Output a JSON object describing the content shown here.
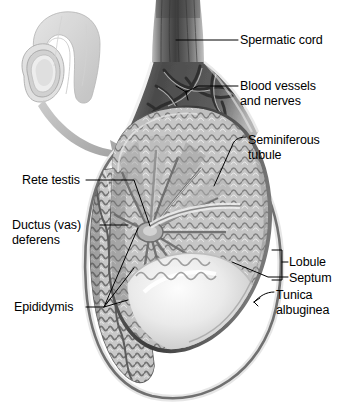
{
  "figure": {
    "background_color": "#ffffff",
    "palette": {
      "ink": "#000000",
      "dark_tissue": "#4a4a4a",
      "mid_tissue": "#8f8f8f",
      "light_tissue": "#c8c8c8",
      "pale_tissue": "#e2e2e2",
      "highlight": "#f4f4f4",
      "outline": "#5a5a5a",
      "arrow": "#a9a9a9",
      "inset": "#d0d0d0"
    }
  },
  "inset": {
    "name": "penis-and-scrotum-orientation-inset",
    "description": "Small pale gray drawing of the penis and scrotum showing the location of the magnified testis"
  },
  "arrow": {
    "name": "magnification-arrow",
    "description": "Curved gray arrow sweeping from the inset down to the main testis illustration"
  },
  "labels": [
    {
      "id": "spermatic-cord",
      "text": "Spermatic cord",
      "side": "right",
      "x": 240,
      "y": 33,
      "lines": 1
    },
    {
      "id": "blood-vessels-and-nerves",
      "text": "Blood vessels\nand nerves",
      "side": "right",
      "x": 240,
      "y": 79,
      "lines": 2
    },
    {
      "id": "seminiferous-tubule",
      "text": "Seminiferous\ntubule",
      "side": "right",
      "x": 248,
      "y": 133,
      "lines": 2
    },
    {
      "id": "rete-testis",
      "text": "Rete testis",
      "side": "left",
      "x": 22,
      "y": 173,
      "lines": 1
    },
    {
      "id": "ductus-vas-deferens",
      "text": "Ductus (vas)\ndeferens",
      "side": "left",
      "x": 12,
      "y": 218,
      "lines": 2
    },
    {
      "id": "epididymis",
      "text": "Epididymis",
      "side": "left",
      "x": 14,
      "y": 300,
      "lines": 1
    },
    {
      "id": "lobule",
      "text": "Lobule",
      "side": "right",
      "x": 289,
      "y": 255,
      "lines": 1
    },
    {
      "id": "septum",
      "text": "Septum",
      "side": "right",
      "x": 289,
      "y": 271,
      "lines": 1
    },
    {
      "id": "tunica-albuginea",
      "text": "Tunica\nalbuginea",
      "side": "right",
      "x": 276,
      "y": 288,
      "lines": 2
    }
  ]
}
